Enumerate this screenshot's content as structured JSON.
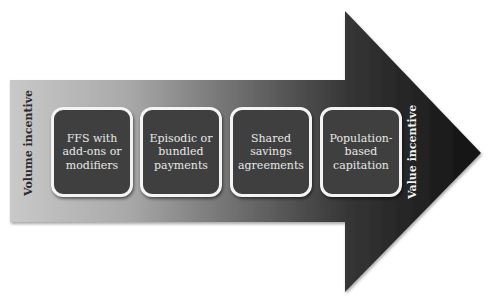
{
  "diagram": {
    "type": "progression-arrow",
    "left_label": "Volume incentive",
    "right_label": "Value incentive",
    "stages": [
      {
        "label": "FFS with\nadd-ons or\nmodifiers"
      },
      {
        "label": "Episodic or\nbundled\npayments"
      },
      {
        "label": "Shared\nsavings\nagreements"
      },
      {
        "label": "Population-\nbased\ncapitation"
      }
    ],
    "colors": {
      "arrow_start": "#c8c8c8",
      "arrow_end": "#141414",
      "box_fill": "#3f3f3f",
      "box_border": "#f4f4f4",
      "box_text": "#e8e8e8"
    }
  }
}
